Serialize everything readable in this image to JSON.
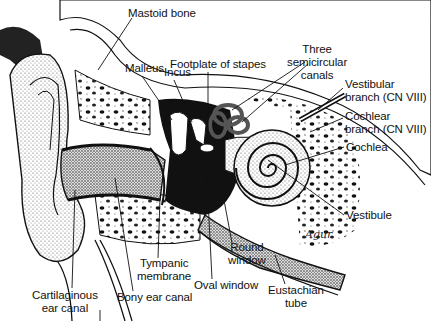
{
  "figure": {
    "signature": "Agur"
  },
  "labels": [
    {
      "id": "mastoid-bone",
      "text": "Mastoid bone",
      "x": 128,
      "y": 7,
      "lines": [
        "Mastoid bone"
      ]
    },
    {
      "id": "malleus",
      "text": "Malleus",
      "x": 125,
      "y": 62,
      "lines": [
        "Malleus"
      ]
    },
    {
      "id": "incus",
      "text": "Incus",
      "x": 164,
      "y": 66,
      "lines": [
        "Incus"
      ]
    },
    {
      "id": "footplate-of-stapes",
      "text": "Footplate of stapes",
      "x": 170,
      "y": 60,
      "lines": [
        "Footplate of stapes"
      ]
    },
    {
      "id": "three-semicircular-canals",
      "text": "Three semicircular canals",
      "x": 288,
      "y": 44,
      "lines": [
        "Three",
        "semicircular",
        "canals"
      ]
    },
    {
      "id": "vestibular-branch",
      "text": "Vestibular branch (CN VIII)",
      "x": 345,
      "y": 78,
      "lines": [
        "Vestibular",
        "branch (CN VIII)"
      ]
    },
    {
      "id": "cochlear-branch",
      "text": "Cochlear branch (CN VIII)",
      "x": 345,
      "y": 110,
      "lines": [
        "Cochlear",
        "branch (CN VIII)"
      ]
    },
    {
      "id": "cochlea",
      "text": "Cochlea",
      "x": 346,
      "y": 141,
      "lines": [
        "Cochlea"
      ]
    },
    {
      "id": "vestibule",
      "text": "Vestibule",
      "x": 346,
      "y": 209,
      "lines": [
        "Vestibule"
      ]
    },
    {
      "id": "round-window",
      "text": "Round window",
      "x": 229,
      "y": 241,
      "lines": [
        "Round",
        "window"
      ]
    },
    {
      "id": "tympanic-membrane",
      "text": "Tympanic membrane",
      "x": 139,
      "y": 258,
      "lines": [
        "Tympanic",
        "membrane"
      ]
    },
    {
      "id": "oval-window",
      "text": "Oval window",
      "x": 194,
      "y": 280,
      "lines": [
        "Oval window"
      ]
    },
    {
      "id": "eustachian-tube",
      "text": "Eustachian tube",
      "x": 268,
      "y": 284,
      "lines": [
        "Eustachian",
        "tube"
      ]
    },
    {
      "id": "bony-ear-canal",
      "text": "Bony ear canal",
      "x": 117,
      "y": 292,
      "lines": [
        "Bony ear canal"
      ]
    },
    {
      "id": "cartilaginous-ear-canal",
      "text": "Cartilaginous ear canal",
      "x": 32,
      "y": 290,
      "lines": [
        "Cartilaginous",
        "ear canal"
      ]
    }
  ]
}
